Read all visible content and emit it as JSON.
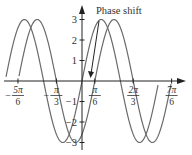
{
  "chart_data": {
    "type": "line",
    "title": "",
    "annotation": "Phase shift",
    "xlabel": "",
    "ylabel": "",
    "x_tick_labels": [
      {
        "num": "5π",
        "den": "6",
        "sign": "−",
        "value": -2.618
      },
      {
        "num": "π",
        "den": "3",
        "sign": "−",
        "value": -1.047
      },
      {
        "num": "π",
        "den": "6",
        "sign": "",
        "value": 0.524
      },
      {
        "num": "2π",
        "den": "3",
        "sign": "",
        "value": 2.094
      },
      {
        "num": "7π",
        "den": "6",
        "sign": "",
        "value": 3.665
      }
    ],
    "y_tick_labels": [
      "3",
      "2",
      "1",
      "−1",
      "−2",
      "−3"
    ],
    "y_ticks": [
      3,
      2,
      1,
      -1,
      -2,
      -3
    ],
    "ylim": [
      -3,
      3
    ],
    "xlim": [
      -3.1,
      4.0
    ],
    "grid": false,
    "series": [
      {
        "name": "y = 3 sin 2x",
        "amplitude": 3,
        "frequency": 2,
        "phase_shift": 0
      },
      {
        "name": "y = 3 sin(2x − π/3)",
        "amplitude": 3,
        "frequency": 2,
        "phase_shift": 0.524
      }
    ],
    "curve_color": "#6a6a6a"
  },
  "geometry": {
    "origin_x": 82,
    "origin_y": 81,
    "px_per_unit_y": 20.5,
    "px_per_pi6": 12.8,
    "x_start": 5,
    "x_end_a": 158,
    "x_end_b": 171
  }
}
